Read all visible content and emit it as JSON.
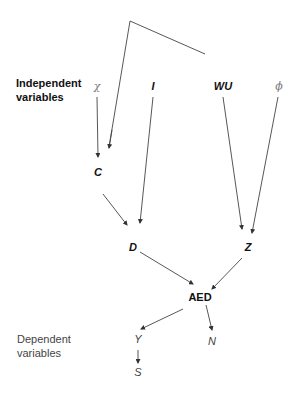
{
  "diagram": {
    "type": "causal-flow",
    "group_labels": {
      "independent": "Independent variables",
      "independent_line1": "Independent",
      "independent_line2": "variables",
      "dependent": "Dependent variables",
      "dependent_line1": "Dependent",
      "dependent_line2": "variables"
    },
    "nodes": {
      "chi": "χ",
      "I": "I",
      "WU": "WU",
      "phi": "ϕ",
      "C": "C",
      "D": "D",
      "Z": "Z",
      "AED": "AED",
      "Y": "Y",
      "N": "N",
      "S": "S"
    },
    "edges": [
      {
        "from": "χ",
        "to": "C"
      },
      {
        "from": "top-bracket",
        "to": "C"
      },
      {
        "from": "C",
        "to": "D"
      },
      {
        "from": "I",
        "to": "D"
      },
      {
        "from": "WU",
        "to": "Z"
      },
      {
        "from": "ϕ",
        "to": "Z"
      },
      {
        "from": "D",
        "to": "AED"
      },
      {
        "from": "Z",
        "to": "AED"
      },
      {
        "from": "AED",
        "to": "Y"
      },
      {
        "from": "AED",
        "to": "N"
      },
      {
        "from": "Y",
        "to": "S"
      }
    ],
    "colors": {
      "line": "#333333",
      "background": "#ffffff"
    }
  }
}
